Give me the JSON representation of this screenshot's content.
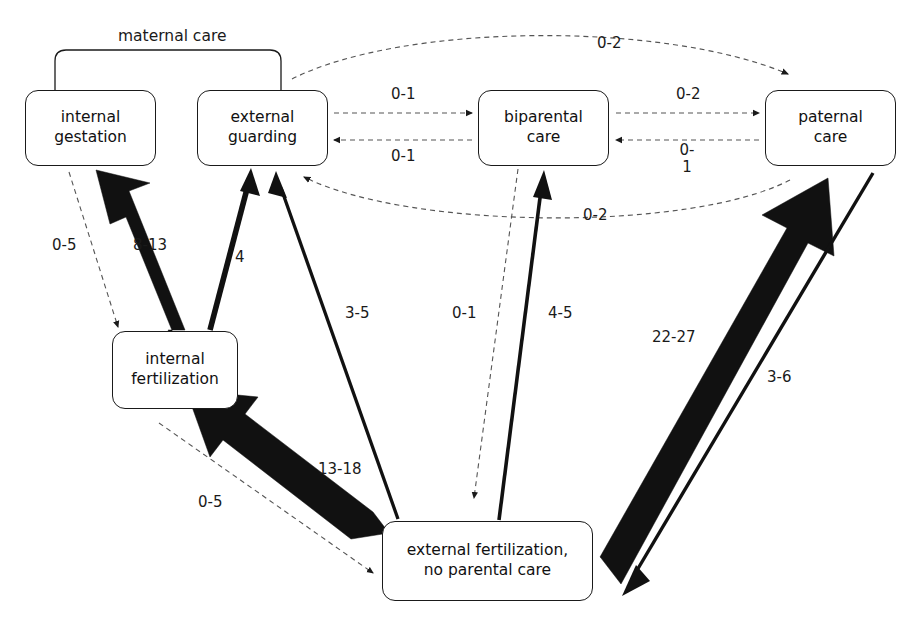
{
  "diagram": {
    "title": "maternal care",
    "group_label": {
      "text": "maternal care",
      "x": 120,
      "y": 28,
      "bracket": {
        "x1": 55,
        "x2": 281,
        "y": 50,
        "drop": 40
      }
    },
    "nodes": [
      {
        "id": "internal-gestation",
        "line1": "internal",
        "line2": "gestation",
        "x": 25,
        "y": 90,
        "w": 131,
        "h": 76
      },
      {
        "id": "external-guarding",
        "line1": "external",
        "line2": "guarding",
        "x": 197,
        "y": 90,
        "w": 131,
        "h": 76
      },
      {
        "id": "biparental-care",
        "line1": "biparental",
        "line2": "care",
        "x": 478,
        "y": 90,
        "w": 131,
        "h": 76
      },
      {
        "id": "paternal-care",
        "line1": "paternal",
        "line2": "care",
        "x": 765,
        "y": 90,
        "w": 131,
        "h": 76
      },
      {
        "id": "internal-fertilization",
        "line1": "internal",
        "line2": "fertilization",
        "x": 112,
        "y": 331,
        "w": 126,
        "h": 78
      },
      {
        "id": "external-fertilization",
        "line1": "external fertilization,",
        "line2": "no parental care",
        "x": 382,
        "y": 521,
        "w": 211,
        "h": 80
      }
    ],
    "edges": [
      {
        "id": "guarding-to-paternal-top",
        "label": "0-2",
        "style": "dashed",
        "weight": "thin",
        "lx": 597,
        "ly": 35
      },
      {
        "id": "guarding-to-biparental",
        "label": "0-1",
        "style": "dashed",
        "weight": "thin",
        "lx": 391,
        "ly": 86
      },
      {
        "id": "biparental-to-guarding",
        "label": "0-1",
        "style": "dashed",
        "weight": "thin",
        "lx": 391,
        "ly": 148
      },
      {
        "id": "biparental-to-paternal",
        "label": "0-2",
        "style": "dashed",
        "weight": "thin",
        "lx": 676,
        "ly": 86
      },
      {
        "id": "paternal-to-biparental",
        "label": "0-\n1",
        "style": "dashed",
        "weight": "thin",
        "lx": 676,
        "ly": 142
      },
      {
        "id": "paternal-to-guarding-bottom",
        "label": "0-2",
        "style": "dashed",
        "weight": "thin",
        "lx": 583,
        "ly": 207
      },
      {
        "id": "gestation-to-fertilization",
        "label": "0-5",
        "style": "dashed",
        "weight": "thin",
        "lx": 52,
        "ly": 237
      },
      {
        "id": "intfert-to-gestation",
        "label": "8-13",
        "style": "solid",
        "weight": "heavy",
        "lx": 133,
        "ly": 237
      },
      {
        "id": "intfert-to-guarding",
        "label": "4",
        "style": "solid",
        "weight": "bold",
        "lx": 235,
        "ly": 249
      },
      {
        "id": "extfert-to-guarding",
        "label": "3-5",
        "style": "solid",
        "weight": "bold",
        "lx": 348,
        "ly": 313
      },
      {
        "id": "biparental-to-extfert",
        "label": "0-1",
        "style": "dashed",
        "weight": "thin",
        "lx": 456,
        "ly": 313
      },
      {
        "id": "extfert-to-biparental",
        "label": "4-5",
        "style": "solid",
        "weight": "bold",
        "lx": 552,
        "ly": 313
      },
      {
        "id": "extfert-to-paternal",
        "label": "22-27",
        "style": "solid",
        "weight": "heavy",
        "lx": 655,
        "ly": 330
      },
      {
        "id": "paternal-to-extfert",
        "label": "3-6",
        "style": "solid",
        "weight": "bold",
        "lx": 770,
        "ly": 371
      },
      {
        "id": "extfert-to-intfert",
        "label": "13-18",
        "style": "solid",
        "weight": "heavy",
        "lx": 320,
        "ly": 462
      },
      {
        "id": "intfert-to-extfert",
        "label": "0-5",
        "style": "dashed",
        "weight": "thin",
        "lx": 200,
        "ly": 495
      }
    ],
    "colors": {
      "ink": "#111111",
      "fill": "#ffffff"
    }
  }
}
